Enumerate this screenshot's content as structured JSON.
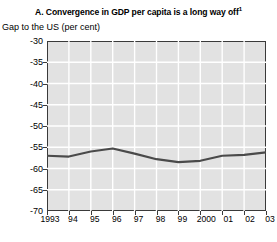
{
  "chart_data": {
    "type": "line",
    "title": "A. Convergence in GDP per capita is a long way off",
    "title_footnote": "1",
    "subtitle": "Gap to the US (per cent)",
    "xlabel": "",
    "ylabel": "Gap to the US (per cent)",
    "categories": [
      "1993",
      "94",
      "95",
      "96",
      "97",
      "98",
      "99",
      "2000",
      "01",
      "02",
      "03"
    ],
    "x": [
      1993,
      1994,
      1995,
      1996,
      1997,
      1998,
      1999,
      2000,
      2001,
      2002,
      2003
    ],
    "values": [
      -57.0,
      -57.2,
      -56.0,
      -55.3,
      -56.5,
      -57.8,
      -58.5,
      -58.2,
      -57.0,
      -56.8,
      -56.2
    ],
    "series": [
      {
        "name": "Gap to the US (per cent)",
        "values": [
          -57.0,
          -57.2,
          -56.0,
          -55.3,
          -56.5,
          -57.8,
          -58.5,
          -58.2,
          -57.0,
          -56.8,
          -56.2
        ]
      }
    ],
    "ylim": [
      -70,
      -30
    ],
    "yticks": [
      -30,
      -35,
      -40,
      -45,
      -50,
      -55,
      -60,
      -65,
      -70
    ],
    "ytick_labels": [
      "-30",
      "-35",
      "-40",
      "-45",
      "-50",
      "-55",
      "-60",
      "-65",
      "-70"
    ],
    "xlim": [
      1993,
      2003
    ],
    "grid": true,
    "grid_color": "#ffffff",
    "plot_background": "#e2e2e2",
    "line_color": "#4a4a4a",
    "axis_color": "#3a3a3a",
    "legend": null,
    "legend_position": "none"
  }
}
